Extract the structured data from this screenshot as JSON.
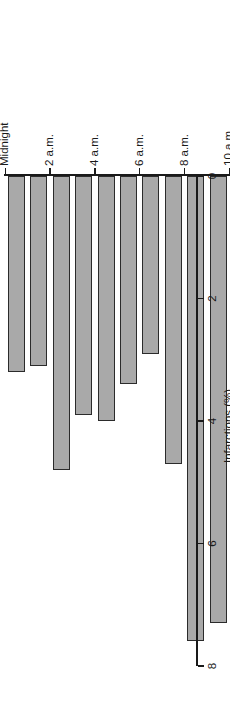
{
  "chart_data": {
    "type": "bar",
    "orientation": "horizontal",
    "title": "",
    "subtitle": "",
    "xlabel": "Infarctions (%)",
    "ylabel": "Time of day",
    "xlim": [
      0,
      8.6
    ],
    "xticks": [
      0,
      2,
      4,
      6,
      8
    ],
    "xticklabels": [
      "0",
      "2",
      "4",
      "6",
      "8"
    ],
    "grid": false,
    "legend": null,
    "bar_color": "#a9a9a9",
    "bar_edge_color": "#2b2b2b",
    "axis_color": "#1a1a1a",
    "background": "#ffffff",
    "categories": [
      "Midnight",
      "1 a.m.",
      "2 a.m.",
      "3 a.m.",
      "4 a.m.",
      "5 a.m.",
      "6 a.m.",
      "7 a.m.",
      "8 a.m.",
      "9 a.m.",
      "10 a.m.",
      "11 a.m.",
      "Noon",
      "1 p.m.",
      "2 p.m.",
      "3 p.m.",
      "4 p.m.",
      "5 p.m.",
      "6 p.m.",
      "7 p.m.",
      "8 p.m.",
      "9 p.m.",
      "10 p.m.",
      "11 p.m."
    ],
    "category_tick_labels": [
      "Midnight",
      "2 a.m.",
      "4 a.m.",
      "6 a.m.",
      "8 a.m.",
      "10 a.m.",
      "Noon",
      "2 p.m.",
      "4 p.m.",
      "6 p.m.",
      "8 p.m.",
      "10 p.m.",
      "Midnight"
    ],
    "category_tick_indices": [
      0,
      2,
      4,
      6,
      8,
      10,
      12,
      14,
      16,
      18,
      20,
      22,
      24
    ],
    "values": [
      3.2,
      3.1,
      4.8,
      3.9,
      4.0,
      3.4,
      2.9,
      4.7,
      7.6,
      7.3,
      6.2,
      3.4,
      3.9,
      2.7,
      5.6,
      4.7,
      4.9,
      2.9,
      4.5,
      4.4,
      3.0,
      2.9,
      3.8,
      4.7
    ]
  }
}
